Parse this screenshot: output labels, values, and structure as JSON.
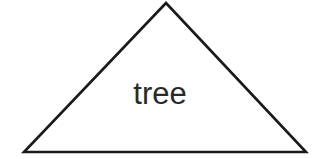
{
  "canvas": {
    "width": 320,
    "height": 159,
    "background_color": "#ffffff"
  },
  "diagram": {
    "type": "triangle-with-label",
    "shape": {
      "name": "triangle",
      "points": "166,3 306,152 24,152",
      "stroke_color": "#1a1a1a",
      "stroke_width": 2.6,
      "fill": "none",
      "vertices": {
        "apex": [
          166,
          3
        ],
        "bottom_right": [
          306,
          152
        ],
        "bottom_left": [
          24,
          152
        ]
      }
    },
    "label": {
      "text": "tree",
      "color": "#2a2a2a",
      "font_size": 31,
      "center_x": 165,
      "baseline_y": 110
    }
  }
}
